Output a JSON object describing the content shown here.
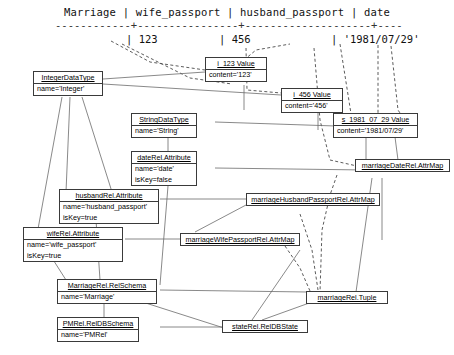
{
  "relational_table": {
    "header_line": "Marriage | wife_passport | husband_passport | date",
    "separator_line": "------------+----------------+--------------------+--------------",
    "row": {
      "wife_passport": "| 123",
      "husband_passport": "| 456",
      "date": "| '1981/07/29'"
    }
  },
  "colors": {
    "box_border": "#3a3a3a",
    "solid_link": "#6b6b6b",
    "dashed_link": "#4a4a4a",
    "background": "#ffffff",
    "text": "#000000"
  },
  "objects": [
    {
      "id": "integer-datatype",
      "title": "IntegerDataType",
      "slots": [
        "name='Integer'"
      ]
    },
    {
      "id": "i-123-value",
      "title": "i_123 Value",
      "slots": [
        "content='123'"
      ]
    },
    {
      "id": "i-456-value",
      "title": "i_456 Value",
      "slots": [
        "content='456'"
      ]
    },
    {
      "id": "s-1981-07-29-value",
      "title": "s_1981_07_29 Value",
      "slots": [
        "content='1981/07/29'"
      ]
    },
    {
      "id": "string-datatype",
      "title": "StringDataType",
      "slots": [
        "name='String'"
      ]
    },
    {
      "id": "daterel-attribute",
      "title": "dateRel.Attribute",
      "slots": [
        "name='date'",
        "isKey=false"
      ]
    },
    {
      "id": "marriagedaterel-attrmap",
      "title": "marriageDateRel.AttrMap",
      "slots": []
    },
    {
      "id": "husbandrel-attribute",
      "title": "husbandRel.Attribute",
      "slots": [
        "name='husband_passport'",
        "isKey=true"
      ]
    },
    {
      "id": "marriagehusbandpassportrel-attrmap",
      "title": "marriageHusbandPassportRel.AttrMap",
      "slots": []
    },
    {
      "id": "wiferel-attribute",
      "title": "wifeRel.Attribute",
      "slots": [
        "name='wife_passport'",
        "isKey=true"
      ]
    },
    {
      "id": "marriagewifepassportrel-attrmap",
      "title": "marriageWifePassportRel.AttrMap",
      "slots": []
    },
    {
      "id": "marriagerel-relschema",
      "title": "MarriageRel.RelSchema",
      "slots": [
        "name='Marriage'"
      ]
    },
    {
      "id": "marriagerel-tuple",
      "title": "marriageRel.Tuple",
      "slots": []
    },
    {
      "id": "pmrel-reldbschema",
      "title": "PMRel.RelDBSchema",
      "slots": [
        "name='PMRel'"
      ]
    },
    {
      "id": "staterel-reldbstate",
      "title": "stateRel.RelDBState",
      "slots": []
    }
  ]
}
